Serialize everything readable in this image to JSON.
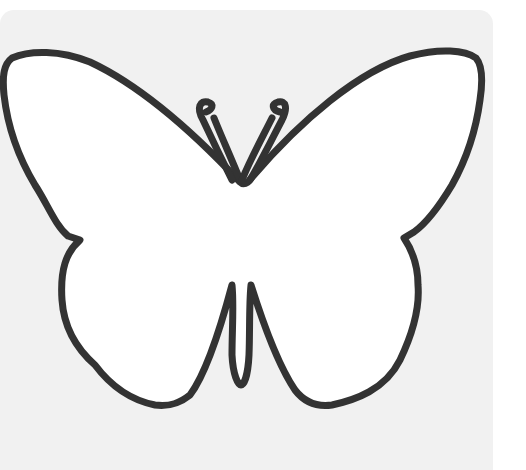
{
  "image": {
    "subject": "butterfly outline",
    "style": "coloring-page line art",
    "colors": {
      "background": "#f1f1f1",
      "outer_background": "#ffffff",
      "fill": "#ffffff",
      "stroke": "#333333"
    },
    "caption": ""
  }
}
